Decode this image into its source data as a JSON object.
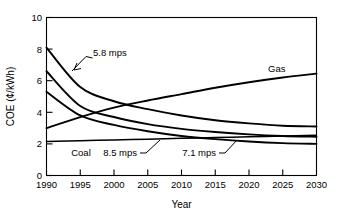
{
  "chart_data": {
    "type": "line",
    "title": "",
    "xlabel": "Year",
    "ylabel": "COE (¢/kWh)",
    "xlim": [
      1990,
      2030
    ],
    "ylim": [
      0,
      10
    ],
    "grid": false,
    "legend_position": "inline-annotations",
    "x_ticks": [
      "1990",
      "1995",
      "2000",
      "2005",
      "2010",
      "2015",
      "2020",
      "2025",
      "2030"
    ],
    "y_ticks": [
      "0",
      "2",
      "4",
      "6",
      "8",
      "10"
    ],
    "x": [
      1990,
      1995,
      2000,
      2005,
      2010,
      2015,
      2020,
      2025,
      2030
    ],
    "series": [
      {
        "name": "5.8 mps",
        "label": "5.8 mps",
        "values": [
          8.1,
          5.6,
          4.7,
          4.2,
          3.8,
          3.5,
          3.3,
          3.15,
          3.1
        ]
      },
      {
        "name": "7.1 mps",
        "label": "7.1 mps",
        "values": [
          6.6,
          4.4,
          3.7,
          3.25,
          2.95,
          2.75,
          2.6,
          2.5,
          2.45
        ]
      },
      {
        "name": "8.5 mps",
        "label": "8.5 mps",
        "values": [
          5.3,
          3.8,
          3.2,
          2.8,
          2.5,
          2.3,
          2.15,
          2.05,
          2.0
        ]
      },
      {
        "name": "Gas",
        "label": "Gas",
        "values": [
          3.0,
          3.7,
          4.3,
          4.75,
          5.15,
          5.55,
          5.9,
          6.2,
          6.45
        ]
      },
      {
        "name": "Coal",
        "label": "Coal",
        "values": [
          2.15,
          2.2,
          2.25,
          2.3,
          2.35,
          2.4,
          2.45,
          2.5,
          2.55
        ]
      }
    ],
    "annotations": [
      {
        "text": "5.8 mps",
        "anchor_series": "5.8 mps"
      },
      {
        "text": "Gas",
        "anchor_series": "Gas"
      },
      {
        "text": "Coal",
        "anchor_series": "Coal"
      },
      {
        "text": "8.5 mps",
        "anchor_series": "8.5 mps"
      },
      {
        "text": "7.1 mps",
        "anchor_series": "7.1 mps"
      }
    ]
  }
}
